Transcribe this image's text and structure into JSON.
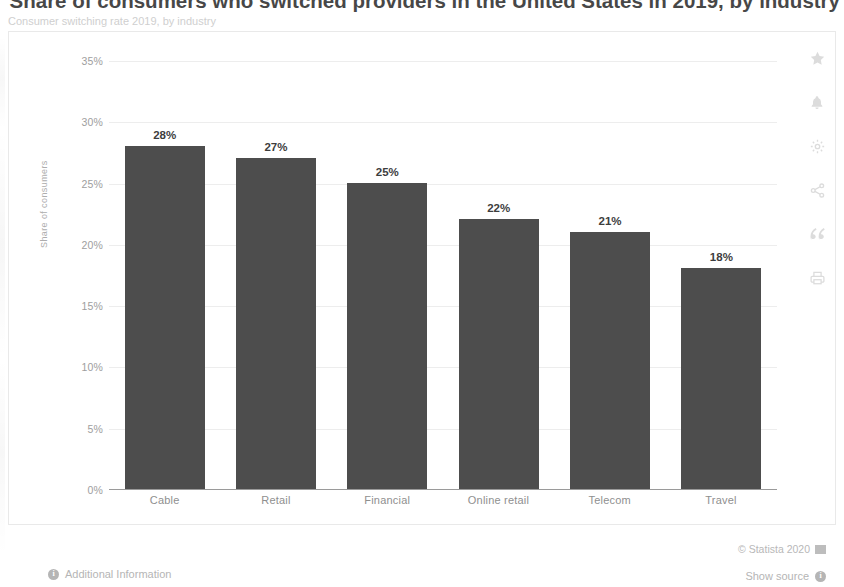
{
  "header": {
    "title": "Share of consumers who switched providers in the United States in 2019, by industry",
    "subtitle": "Consumer switching rate 2019, by industry"
  },
  "chart_data": {
    "type": "bar",
    "title": "Share of consumers who switched providers in the United States in 2019, by industry",
    "categories": [
      "Cable",
      "Retail",
      "Financial",
      "Online retail",
      "Telecom",
      "Travel"
    ],
    "values": [
      28,
      27,
      25,
      22,
      21,
      18
    ],
    "data_labels": [
      "28%",
      "27%",
      "25%",
      "22%",
      "21%",
      "18%"
    ],
    "xlabel": "",
    "ylabel": "Share of consumers",
    "ylim": [
      0,
      35
    ],
    "ytick_labels": [
      "35%",
      "30%",
      "25%",
      "20%",
      "15%",
      "10%",
      "5%",
      "0%"
    ],
    "ytick_values": [
      35,
      30,
      25,
      20,
      15,
      10,
      5,
      0
    ],
    "grid": true,
    "legend": "none",
    "bar_color": "#4d4d4d"
  },
  "rail": {
    "items": [
      {
        "icon": "star-icon",
        "label": "Add to favorites"
      },
      {
        "icon": "bell-icon",
        "label": "Create alert"
      },
      {
        "icon": "gear-icon",
        "label": "Settings"
      },
      {
        "icon": "share-icon",
        "label": "Share"
      },
      {
        "icon": "quote-icon",
        "label": "Cite"
      },
      {
        "icon": "print-icon",
        "label": "Print"
      }
    ]
  },
  "footer": {
    "copyright": "© Statista 2020",
    "additional_information": "Additional Information",
    "show_source": "Show source",
    "info_glyph": "i"
  }
}
